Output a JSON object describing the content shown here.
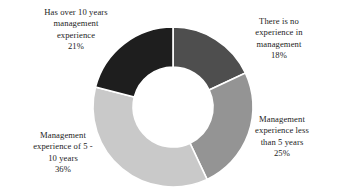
{
  "chart_data": {
    "type": "pie",
    "variant": "donut",
    "title": "",
    "subtitle": "",
    "xlabel": "",
    "ylabel": "",
    "legend_position": "none",
    "grid": false,
    "hole_ratio": 0.5,
    "start_angle_deg": 0,
    "direction": "clockwise",
    "units": "%",
    "categories": [
      "There is no experience in management",
      "Management experience less than 5 years",
      "Management experience of 5 - 10 years",
      "Has over 10 years management experience"
    ],
    "values": [
      18,
      25,
      36,
      21
    ],
    "colors": [
      "#4e4e4e",
      "#949494",
      "#c9c9c9",
      "#1e1e1e"
    ],
    "slices": [
      {
        "label": "There is no experience in management",
        "label_lines": [
          "There is no",
          "experience in",
          "management"
        ],
        "value": 18,
        "value_text": "18%",
        "color": "#4e4e4e",
        "start_deg": 0,
        "end_deg": 64.8
      },
      {
        "label": "Management experience less than 5 years",
        "label_lines": [
          "Management",
          "experience less",
          "than 5 years"
        ],
        "value": 25,
        "value_text": "25%",
        "color": "#949494",
        "start_deg": 64.8,
        "end_deg": 154.8
      },
      {
        "label": "Management experience of 5 - 10 years",
        "label_lines": [
          "Management",
          "experience of 5 -",
          "10 years"
        ],
        "value": 36,
        "value_text": "36%",
        "color": "#c9c9c9",
        "start_deg": 154.8,
        "end_deg": 284.4
      },
      {
        "label": "Has over 10 years management experience",
        "label_lines": [
          "Has over 10 years",
          "management",
          "experience"
        ],
        "value": 21,
        "value_text": "21%",
        "color": "#1e1e1e",
        "start_deg": 284.4,
        "end_deg": 360
      }
    ]
  },
  "labels": {
    "over_10_years": {
      "line1": "Has over 10 years",
      "line2": "management",
      "line3": "experience",
      "percent": "21%"
    },
    "no_experience": {
      "line1": "There is no",
      "line2": "experience in",
      "line3": "management",
      "percent": "18%"
    },
    "less_than_5_years": {
      "line1": "Management",
      "line2": "experience less",
      "line3": "than 5 years",
      "percent": "25%"
    },
    "five_to_10_years": {
      "line1": "Management",
      "line2": "experience of 5 -",
      "line3": "10 years",
      "percent": "36%"
    }
  },
  "style": {
    "background": "#ffffff",
    "text_color": "#1c1c1c",
    "slice_border": "#ffffff"
  }
}
